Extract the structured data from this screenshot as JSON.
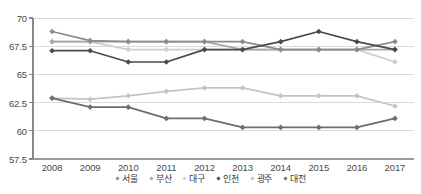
{
  "chart_data": {
    "type": "line",
    "title": "",
    "xlabel": "",
    "ylabel": "",
    "categories": [
      "2008",
      "2009",
      "2010",
      "2011",
      "2012",
      "2013",
      "2014",
      "2015",
      "2016",
      "2017"
    ],
    "ylim": [
      57.5,
      70
    ],
    "yticks": [
      57.5,
      60,
      62.5,
      65,
      67.5,
      70
    ],
    "ytick_labels": [
      "57.5",
      "60",
      "62.5",
      "65",
      "67.5",
      "70"
    ],
    "grid": true,
    "legend_position": "bottom",
    "series": [
      {
        "name": "서울",
        "color": "#8c8c8c",
        "values": [
          68.8,
          68.0,
          67.9,
          67.9,
          67.9,
          67.9,
          67.2,
          67.2,
          67.2,
          67.9
        ]
      },
      {
        "name": "부산",
        "color": "#a8a8a8",
        "values": [
          67.9,
          67.9,
          67.9,
          67.9,
          67.9,
          67.2,
          67.2,
          67.2,
          67.2,
          67.2
        ]
      },
      {
        "name": "대구",
        "color": "#cfcfcf",
        "values": [
          67.9,
          67.9,
          67.2,
          67.2,
          67.2,
          67.2,
          67.2,
          67.2,
          67.2,
          66.1
        ]
      },
      {
        "name": "인천",
        "color": "#4a4a4a",
        "values": [
          67.1,
          67.1,
          66.1,
          66.1,
          67.2,
          67.2,
          67.9,
          68.8,
          67.9,
          67.2
        ]
      },
      {
        "name": "광주",
        "color": "#c4c4c4",
        "values": [
          62.9,
          62.8,
          63.1,
          63.5,
          63.8,
          63.8,
          63.1,
          63.1,
          63.1,
          62.2
        ]
      },
      {
        "name": "대전",
        "color": "#6e6e6e",
        "values": [
          62.9,
          62.1,
          62.1,
          61.1,
          61.1,
          60.3,
          60.3,
          60.3,
          60.3,
          61.1
        ]
      }
    ]
  },
  "legend": {
    "items": [
      {
        "label": "서울"
      },
      {
        "label": "부산"
      },
      {
        "label": "대구"
      },
      {
        "label": "인천"
      },
      {
        "label": "광주"
      },
      {
        "label": "대전"
      }
    ]
  },
  "axes": {
    "y_labels": [
      "70",
      "67.5",
      "65",
      "62.5",
      "60",
      "57.5"
    ],
    "x_labels": [
      "2008",
      "2009",
      "2010",
      "2011",
      "2012",
      "2013",
      "2014",
      "2015",
      "2016",
      "2017"
    ]
  },
  "colors": {
    "axis": "#777777",
    "grid": "#d9d9d9",
    "background": "#ffffff"
  }
}
